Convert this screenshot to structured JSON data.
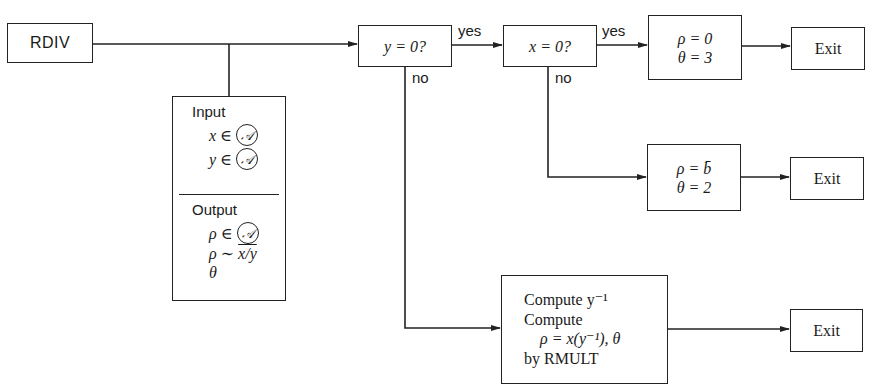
{
  "diagram": {
    "start": {
      "label": "RDIV"
    },
    "io": {
      "input_heading": "Input",
      "inputs": [
        {
          "var": "x",
          "op": "∈",
          "set": "𝒜"
        },
        {
          "var": "y",
          "op": "∈",
          "set": "𝒜"
        }
      ],
      "output_heading": "Output",
      "outputs": [
        {
          "var": "ρ",
          "op": "∈",
          "set": "𝒜"
        },
        {
          "var": "ρ",
          "op": "∼",
          "expr": "x/y"
        },
        {
          "var": "θ"
        }
      ]
    },
    "decisions": [
      {
        "id": "y_zero",
        "label": "y = 0?",
        "yes_label": "yes",
        "no_label": "no"
      },
      {
        "id": "x_zero",
        "label": "x = 0?",
        "yes_label": "yes",
        "no_label": "no"
      }
    ],
    "results": [
      {
        "id": "zero_result",
        "lines": [
          "ρ = 0",
          "θ = 3"
        ]
      },
      {
        "id": "bbar_result",
        "lines": [
          "ρ = b̄",
          "θ = 2"
        ]
      },
      {
        "id": "compute_result",
        "lines": [
          "Compute y⁻¹",
          "Compute",
          "ρ = x(y⁻¹), θ",
          "by RMULT"
        ]
      }
    ],
    "exits": [
      {
        "label": "Exit"
      },
      {
        "label": "Exit"
      },
      {
        "label": "Exit"
      }
    ]
  }
}
